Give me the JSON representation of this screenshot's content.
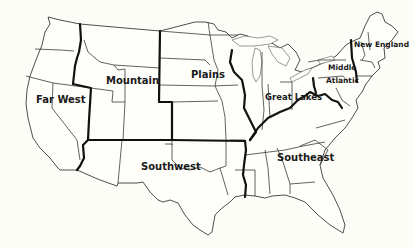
{
  "map": {
    "title": "United States economic regions",
    "colors": {
      "background": "#fdfdf8",
      "region_border": "#111111",
      "state_line": "#3a3a3a",
      "label": "#1a1a1a"
    },
    "regions": [
      {
        "id": "far-west",
        "label": "Far West"
      },
      {
        "id": "mountain",
        "label": "Mountain"
      },
      {
        "id": "plains",
        "label": "Plains"
      },
      {
        "id": "great-lakes",
        "label": "Great Lakes"
      },
      {
        "id": "middle-atlantic",
        "label_line1": "Middle",
        "label_line2": "Atlantic"
      },
      {
        "id": "new-england",
        "label": "New England"
      },
      {
        "id": "southwest",
        "label": "Southwest"
      },
      {
        "id": "southeast",
        "label": "Southeast"
      }
    ]
  }
}
